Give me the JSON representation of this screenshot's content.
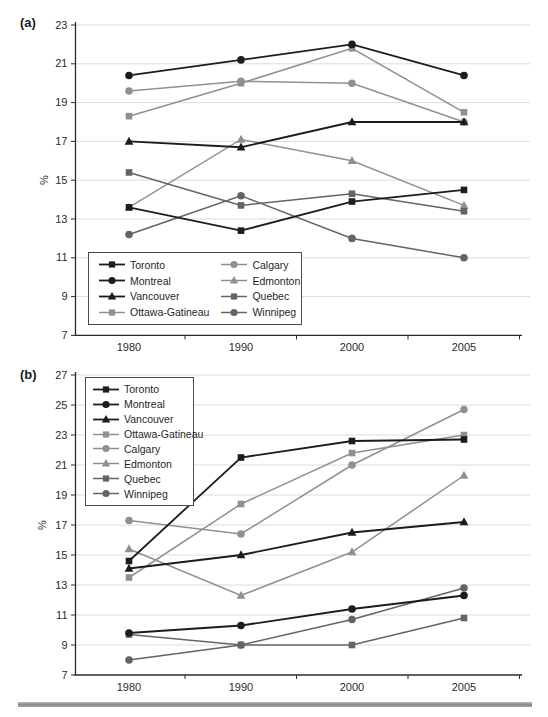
{
  "page": {
    "bottom_rule_color": "#9a9a9a"
  },
  "colors": {
    "black_series": "#1c1c1c",
    "gray_series": "#909090",
    "dark_gray_series": "#646464",
    "grid": "#dcdcdc",
    "axis": "#2b2b2b"
  },
  "chart_data": [
    {
      "type": "line",
      "panel_label": "(a)",
      "ylabel": "%",
      "ylim": [
        7,
        23
      ],
      "yticks": [
        7,
        9,
        11,
        13,
        15,
        17,
        19,
        21,
        23
      ],
      "categories": [
        "1980",
        "1990",
        "2000",
        "2005"
      ],
      "grid": true,
      "legend_position": "bottom-left",
      "legend_columns": 2,
      "series": [
        {
          "name": "Toronto",
          "marker": "square",
          "color": "#1c1c1c",
          "values": [
            13.6,
            12.4,
            13.9,
            14.5
          ]
        },
        {
          "name": "Montreal",
          "marker": "circle",
          "color": "#1c1c1c",
          "values": [
            20.4,
            21.2,
            22.0,
            20.4
          ]
        },
        {
          "name": "Vancouver",
          "marker": "triangle",
          "color": "#1c1c1c",
          "values": [
            17.0,
            16.7,
            18.0,
            18.0
          ]
        },
        {
          "name": "Ottawa-Gatineau",
          "marker": "square",
          "color": "#909090",
          "values": [
            18.3,
            20.0,
            21.8,
            18.5
          ]
        },
        {
          "name": "Calgary",
          "marker": "circle",
          "color": "#909090",
          "values": [
            19.6,
            20.1,
            20.0,
            18.0
          ]
        },
        {
          "name": "Edmonton",
          "marker": "triangle",
          "color": "#909090",
          "values": [
            13.6,
            17.1,
            16.0,
            13.7
          ]
        },
        {
          "name": "Quebec",
          "marker": "square",
          "color": "#646464",
          "values": [
            15.4,
            13.7,
            14.3,
            13.4
          ]
        },
        {
          "name": "Winnipeg",
          "marker": "circle",
          "color": "#646464",
          "values": [
            12.2,
            14.2,
            12.0,
            11.0
          ]
        }
      ]
    },
    {
      "type": "line",
      "panel_label": "(b)",
      "ylabel": "%",
      "ylim": [
        7,
        27
      ],
      "yticks": [
        7,
        9,
        11,
        13,
        15,
        17,
        19,
        21,
        23,
        25,
        27
      ],
      "categories": [
        "1980",
        "1990",
        "2000",
        "2005"
      ],
      "grid": true,
      "legend_position": "top-left",
      "legend_columns": 1,
      "series": [
        {
          "name": "Toronto",
          "marker": "square",
          "color": "#1c1c1c",
          "values": [
            14.6,
            21.5,
            22.6,
            22.7
          ]
        },
        {
          "name": "Montreal",
          "marker": "circle",
          "color": "#1c1c1c",
          "values": [
            9.8,
            10.3,
            11.4,
            12.3
          ]
        },
        {
          "name": "Vancouver",
          "marker": "triangle",
          "color": "#1c1c1c",
          "values": [
            14.1,
            15.0,
            16.5,
            17.2
          ]
        },
        {
          "name": "Ottawa-Gatineau",
          "marker": "square",
          "color": "#909090",
          "values": [
            13.5,
            18.4,
            21.8,
            23.0
          ]
        },
        {
          "name": "Calgary",
          "marker": "circle",
          "color": "#909090",
          "values": [
            17.3,
            16.4,
            21.0,
            24.7
          ]
        },
        {
          "name": "Edmonton",
          "marker": "triangle",
          "color": "#909090",
          "values": [
            15.4,
            12.3,
            15.2,
            20.3
          ]
        },
        {
          "name": "Quebec",
          "marker": "square",
          "color": "#646464",
          "values": [
            9.7,
            9.0,
            9.0,
            10.8
          ]
        },
        {
          "name": "Winnipeg",
          "marker": "circle",
          "color": "#646464",
          "values": [
            8.0,
            9.0,
            10.7,
            12.8
          ]
        }
      ]
    }
  ]
}
